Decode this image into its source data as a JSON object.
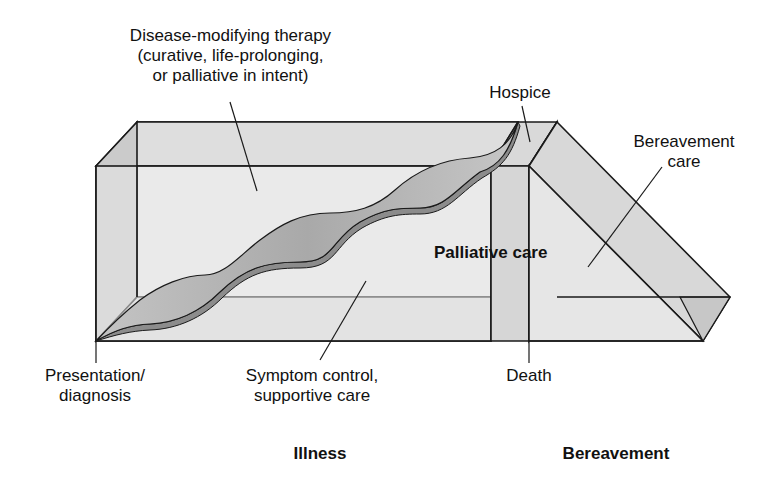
{
  "diagram": {
    "labels": {
      "disease_modifying": {
        "line1": "Disease-modifying therapy",
        "line2": "(curative, life-prolonging,",
        "line3": "or palliative in intent)"
      },
      "hospice": "Hospice",
      "bereavement_care": {
        "line1": "Bereavement",
        "line2": "care"
      },
      "palliative_care": "Palliative care",
      "presentation": {
        "line1": "Presentation/",
        "line2": "diagnosis"
      },
      "symptom_control": {
        "line1": "Symptom control,",
        "line2": "supportive care"
      },
      "death": "Death",
      "illness": "Illness",
      "bereavement": "Bereavement"
    },
    "colors": {
      "box_fill": "#e6e6e6",
      "box_side": "#cfcfcf",
      "ribbon_top": "#b8b8b8",
      "ribbon_edge": "#8a8a8a",
      "stroke": "#1a1a1a"
    }
  }
}
